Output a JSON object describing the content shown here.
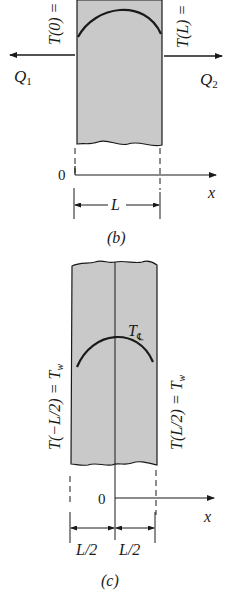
{
  "figure_b": {
    "caption": "(b)",
    "left_temp_label": "T(0) =",
    "right_temp_label": "T(L) =",
    "left_flux_label": "Q",
    "left_flux_sub": "1",
    "right_flux_label": "Q",
    "right_flux_sub": "2",
    "origin_label": "0",
    "axis_label": "x",
    "width_label": "L"
  },
  "figure_c": {
    "caption": "(c)",
    "left_temp_label": "T(−L/2) = T",
    "left_temp_sub": "w",
    "right_temp_label": "T(L/2) = T",
    "right_temp_sub": "w",
    "center_temp_label": "T",
    "center_temp_sub": "℄",
    "origin_label": "0",
    "axis_label": "x",
    "half_width_left": "L/2",
    "half_width_right": "L/2"
  },
  "colors": {
    "slab_fill": "#c9c9c9",
    "line": "#1a1a1a"
  }
}
